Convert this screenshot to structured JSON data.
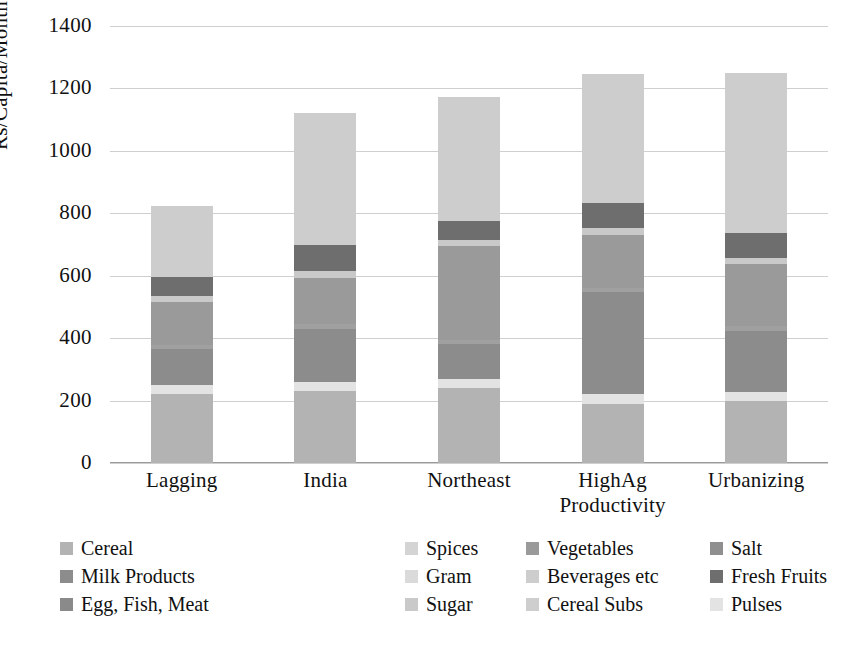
{
  "chart_data": {
    "type": "bar",
    "title": "",
    "xlabel": "",
    "ylabel": "Rs/Capita/Month",
    "ylim": [
      0,
      1400
    ],
    "ytick_step": 200,
    "yticks": [
      "0",
      "200",
      "400",
      "600",
      "800",
      "1000",
      "1200",
      "1400"
    ],
    "grid": true,
    "stacked": true,
    "legend_position": "bottom",
    "categories": [
      "Lagging",
      "India",
      "Northeast",
      "HighAg\nProductivity",
      "Urbanizing"
    ],
    "series": [
      {
        "name": "Cereal",
        "color": "#b3b3b3",
        "values": [
          222,
          230,
          240,
          190,
          198
        ]
      },
      {
        "name": "Pulses",
        "color": "#e3e3e3",
        "values": [
          28,
          30,
          30,
          32,
          30
        ]
      },
      {
        "name": "Milk Products",
        "color": "#8c8c8c",
        "values": [
          115,
          170,
          110,
          325,
          195
        ]
      },
      {
        "name": "Edible Oil",
        "color": "#a0a0a0",
        "values": [
          12,
          14,
          14,
          15,
          15
        ]
      },
      {
        "name": "Vegetables",
        "color": "#9a9a9a",
        "values": [
          140,
          150,
          300,
          170,
          200
        ]
      },
      {
        "name": "Sugar",
        "color": "#c9c9c9",
        "values": [
          18,
          20,
          20,
          20,
          20
        ]
      },
      {
        "name": "Fresh Fruits",
        "color": "#6e6e6e",
        "values": [
          62,
          85,
          60,
          82,
          80
        ]
      },
      {
        "name": "Spices",
        "color": "#d4d4d4",
        "values": [
          0,
          0,
          0,
          0,
          0
        ]
      },
      {
        "name": "Salt",
        "color": "#8f8f8f",
        "values": [
          0,
          0,
          0,
          0,
          0
        ]
      },
      {
        "name": "Gram",
        "color": "#dadada",
        "values": [
          0,
          0,
          0,
          0,
          0
        ]
      },
      {
        "name": "Dry Fruits",
        "color": "#7d7d7d",
        "values": [
          0,
          0,
          0,
          0,
          0
        ]
      },
      {
        "name": "Egg, Fish, Meat",
        "color": "#8a8a8a",
        "values": [
          0,
          0,
          0,
          0,
          0
        ]
      },
      {
        "name": "Cereal Subs",
        "color": "#cecece",
        "values": [
          0,
          0,
          0,
          0,
          0
        ]
      },
      {
        "name": "Beverages etc",
        "color": "#cdcdcd",
        "values": [
          226,
          423,
          398,
          412,
          512
        ]
      }
    ],
    "totals": [
      923,
      1122,
      1172,
      1246,
      1250
    ]
  },
  "legend": {
    "rows": [
      [
        {
          "label": "Cereal",
          "color": "#b3b3b3"
        },
        {
          "label": "Spices",
          "color": "#d4d4d4"
        },
        {
          "label": "Vegetables",
          "color": "#9a9a9a"
        },
        {
          "label": "Salt",
          "color": "#8f8f8f"
        },
        {
          "label": "Edible Oil",
          "color": "#a0a0a0"
        }
      ],
      [
        {
          "label": "Milk Products",
          "color": "#8c8c8c"
        },
        {
          "label": "Gram",
          "color": "#dadada"
        },
        {
          "label": "Beverages etc",
          "color": "#cdcdcd"
        },
        {
          "label": "Fresh Fruits",
          "color": "#6e6e6e"
        },
        {
          "label": "Dry Fruits",
          "color": "#7d7d7d"
        }
      ],
      [
        {
          "label": "Egg, Fish, Meat",
          "color": "#8a8a8a"
        },
        {
          "label": "Sugar",
          "color": "#c9c9c9"
        },
        {
          "label": "Cereal Subs",
          "color": "#cecece"
        },
        {
          "label": "Pulses",
          "color": "#e3e3e3"
        }
      ]
    ]
  },
  "axis": {
    "y_title": "Rs/Capita/Month"
  }
}
